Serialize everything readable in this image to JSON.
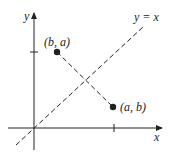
{
  "diagram": {
    "axes": {
      "x_label": "x",
      "y_label": "y"
    },
    "line": {
      "label": "y = x",
      "style": "dashed"
    },
    "points": [
      {
        "label": "(b, a)",
        "name": "point-b-a"
      },
      {
        "label": "(a, b)",
        "name": "point-a-b"
      }
    ],
    "connector": {
      "style": "dashed",
      "from": "(b, a)",
      "to": "(a, b)"
    },
    "ticks": {
      "x_tick": "a",
      "y_tick": "a"
    },
    "colors": {
      "ink": "#222222",
      "background": "#ffffff"
    }
  }
}
